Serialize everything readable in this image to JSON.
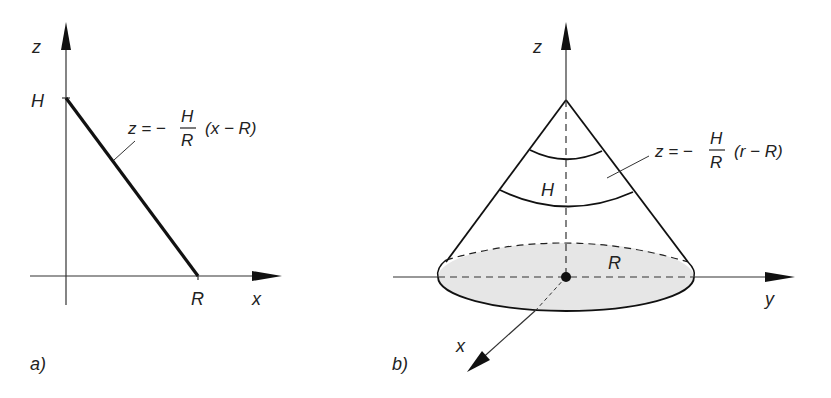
{
  "panel_a": {
    "caption": "a)",
    "axis_z_label": "z",
    "axis_x_label": "x",
    "tick_H_label": "H",
    "tick_R_label": "R",
    "equation": {
      "lhs": "z = −",
      "num": "H",
      "den": "R",
      "rhs": "(x − R)"
    }
  },
  "panel_b": {
    "caption": "b)",
    "axis_z_label": "z",
    "axis_y_label": "y",
    "axis_x_label": "x",
    "height_label": "H",
    "radius_label": "R",
    "equation": {
      "lhs": "z = −",
      "num": "H",
      "den": "R",
      "rhs": "(r − R)"
    }
  },
  "colors": {
    "line": "#1a1a1a",
    "base_fill": "#e6e6e6"
  }
}
